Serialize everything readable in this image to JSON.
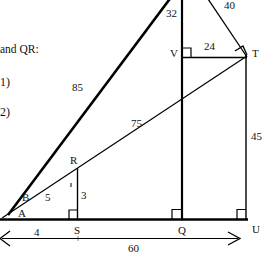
{
  "document": {
    "title": "Geometry figure with similar right triangles",
    "prose_fragment": "and QR:",
    "item_1": "1)",
    "item_2": "2)"
  },
  "figure": {
    "stroke_color": "#000000",
    "thick_stroke_color": "#000000",
    "vertices": [
      {
        "id": "A",
        "label": "A",
        "x": 18,
        "y": 214
      },
      {
        "id": "B",
        "label": "B",
        "x": 22,
        "y": 198
      },
      {
        "id": "R",
        "label": "R",
        "x": 72,
        "y": 163
      },
      {
        "id": "S",
        "label": "S",
        "x": 78,
        "y": 232
      },
      {
        "id": "Q",
        "label": "Q",
        "x": 182,
        "y": 232
      },
      {
        "id": "U",
        "label": "U",
        "x": 252,
        "y": 232
      },
      {
        "id": "T",
        "label": "T",
        "x": 250,
        "y": 55
      },
      {
        "id": "V",
        "label": "V",
        "x": 172,
        "y": 55
      }
    ],
    "measurements": [
      {
        "id": "seg-ab-to-top",
        "label": "85",
        "x": 73,
        "y": 88
      },
      {
        "id": "seg-a-to-t",
        "label": "75",
        "x": 134,
        "y": 124
      },
      {
        "id": "seg-vq-upper",
        "label": "32",
        "x": 168,
        "y": 15
      },
      {
        "id": "seg-top-to-t",
        "label": "40",
        "x": 227,
        "y": 4
      },
      {
        "id": "seg-v-to-t",
        "label": "24",
        "x": 208,
        "y": 49
      },
      {
        "id": "seg-t-to-u",
        "label": "45",
        "x": 253,
        "y": 137
      },
      {
        "id": "seg-b-to-r",
        "label": "5",
        "x": 47,
        "y": 198
      },
      {
        "id": "seg-r-to-s",
        "label": "3",
        "x": 82,
        "y": 196
      },
      {
        "id": "seg-a-to-s",
        "label": "4",
        "x": 36,
        "y": 240
      },
      {
        "id": "seg-a-to-q-total",
        "label": "60",
        "x": 131,
        "y": 250
      }
    ]
  }
}
